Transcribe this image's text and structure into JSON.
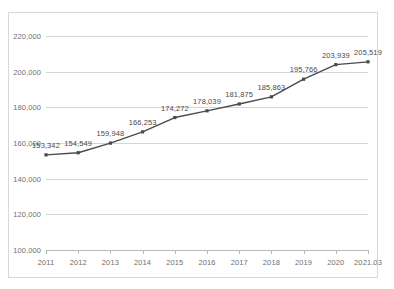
{
  "chart_data": {
    "type": "line",
    "title": "",
    "xlabel": "",
    "ylabel": "",
    "categories": [
      "2011",
      "2012",
      "2013",
      "2014",
      "2015",
      "2016",
      "2017",
      "2018",
      "2019",
      "2020",
      "2021.03"
    ],
    "values": [
      153342,
      154549,
      159948,
      166253,
      174272,
      178039,
      181875,
      185863,
      195766,
      203939,
      205519
    ],
    "point_labels": [
      "153,342",
      "154,549",
      "159,948",
      "166,253",
      "174,272",
      "178,039",
      "181,875",
      "185,863",
      "195,766",
      "203,939",
      "205,519"
    ],
    "ylim": [
      100000,
      220000
    ],
    "ytick_values": [
      220000,
      200000,
      180000,
      160000,
      140000,
      120000,
      100000
    ],
    "ytick_labels": [
      "220,000",
      "200,000",
      "180,000",
      "160,000",
      "140,000",
      "120,000",
      "100,000"
    ],
    "grid": true,
    "legend": "none",
    "series_color": "#4a4a4a",
    "marker": "square",
    "gridline_color": "#d6d6d6",
    "axis_color": "#b8b8b8",
    "label_color": "#6f6f6f"
  },
  "frame": {
    "border_color": "#d8d8d8"
  }
}
